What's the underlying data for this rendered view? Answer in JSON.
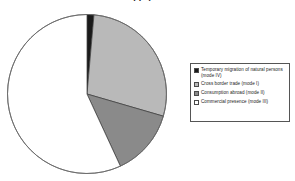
{
  "chart_data": {
    "type": "pie",
    "title": "Share of modes of supply in world services trade",
    "subtitle": "",
    "xlabel": "",
    "ylabel": "",
    "legend_position": "right",
    "grid": false,
    "categories": [
      "Temporary migration of natural persons (mode IV)",
      "Cross border trade (mode I)",
      "Consumption abroad (mode II)",
      "Commercial presence (mode III)"
    ],
    "values": [
      1.4,
      28.1,
      13.6,
      56.9
    ],
    "colors": [
      "#1a1a1a",
      "#b9b9b9",
      "#8a8a8a",
      "#ffffff"
    ],
    "slices": [
      {
        "label": "Temporary migration of natural persons (mode IV)",
        "value": 1.4,
        "color": "#1a1a1a"
      },
      {
        "label": "Cross border trade (mode I)",
        "value": 28.1,
        "color": "#b9b9b9"
      },
      {
        "label": "Consumption abroad (mode II)",
        "value": 13.6,
        "color": "#8a8a8a"
      },
      {
        "label": "Commercial presence (mode III)",
        "value": 56.9,
        "color": "#ffffff"
      }
    ]
  },
  "title": {
    "text": "Share of modes of supply in world services trade"
  },
  "legend": {
    "items": [
      {
        "label": "Temporary migration of natural persons (mode IV)",
        "swatch_name": "legend-swatch-mode-iv",
        "color": "#1a1a1a"
      },
      {
        "label": "Cross border trade (mode I)",
        "swatch_name": "legend-swatch-mode-i",
        "color": "#b9b9b9"
      },
      {
        "label": "Consumption abroad (mode II)",
        "swatch_name": "legend-swatch-mode-ii",
        "color": "#8a8a8a"
      },
      {
        "label": "Commercial presence (mode III)",
        "swatch_name": "legend-swatch-mode-iii",
        "color": "#ffffff"
      }
    ]
  }
}
